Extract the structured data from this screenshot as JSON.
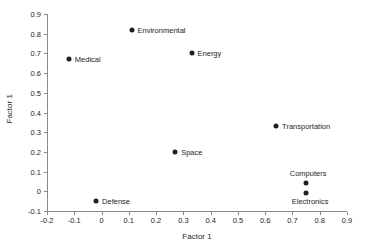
{
  "chart_data": {
    "type": "scatter",
    "title": "",
    "xlabel": "Factor 1",
    "ylabel": "Factor 1",
    "xlim": [
      -0.2,
      0.9
    ],
    "ylim": [
      -0.1,
      0.9
    ],
    "grid": false,
    "legend": "none",
    "xticks": [
      "-0.2",
      "-0.1",
      "0",
      "0.1",
      "0.2",
      "0.3",
      "0.4",
      "0.5",
      "0.6",
      "0.7",
      "0.8",
      "0.9"
    ],
    "xtick_values": [
      -0.2,
      -0.1,
      0,
      0.1,
      0.2,
      0.3,
      0.4,
      0.5,
      0.6,
      0.7,
      0.8,
      0.9
    ],
    "yticks": [
      "-0.1",
      "0",
      "0.1",
      "0.2",
      "0.3",
      "0.4",
      "0.5",
      "0.6",
      "0.7",
      "0.8",
      "0.9"
    ],
    "ytick_values": [
      -0.1,
      0,
      0.1,
      0.2,
      0.3,
      0.4,
      0.5,
      0.6,
      0.7,
      0.8,
      0.9
    ],
    "marker_color": "#231f20",
    "axis_color": "#8a8a8a",
    "points": [
      {
        "label": "Medical",
        "x": -0.12,
        "y": 0.67,
        "label_pos": "right"
      },
      {
        "label": "Environmental",
        "x": 0.11,
        "y": 0.82,
        "label_pos": "right"
      },
      {
        "label": "Energy",
        "x": 0.33,
        "y": 0.7,
        "label_pos": "right"
      },
      {
        "label": "Transportation",
        "x": 0.64,
        "y": 0.33,
        "label_pos": "right"
      },
      {
        "label": "Space",
        "x": 0.27,
        "y": 0.2,
        "label_pos": "right"
      },
      {
        "label": "Computers",
        "x": 0.75,
        "y": 0.04,
        "label_pos": "above"
      },
      {
        "label": "Electronics",
        "x": 0.75,
        "y": -0.01,
        "label_pos": "below"
      },
      {
        "label": "Defense",
        "x": -0.02,
        "y": -0.05,
        "label_pos": "right"
      }
    ]
  }
}
